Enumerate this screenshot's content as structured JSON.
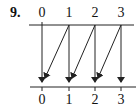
{
  "problem_number": "9.",
  "diagram": {
    "type": "mapping",
    "top_row": {
      "labels": [
        "0",
        "1",
        "2",
        "3"
      ],
      "x": [
        42,
        69,
        95,
        121
      ]
    },
    "bottom_row": {
      "labels": [
        "0",
        "1",
        "2",
        "3"
      ],
      "x": [
        42,
        69,
        95,
        121
      ]
    },
    "arrows": [
      {
        "from": "0",
        "to": "0"
      },
      {
        "from": "1",
        "to": "0"
      },
      {
        "from": "1",
        "to": "1"
      },
      {
        "from": "2",
        "to": "1"
      },
      {
        "from": "2",
        "to": "2"
      },
      {
        "from": "3",
        "to": "2"
      },
      {
        "from": "3",
        "to": "3"
      }
    ],
    "line_color": "#222222"
  }
}
